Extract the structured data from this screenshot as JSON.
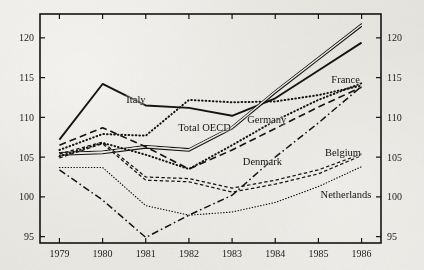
{
  "figure": {
    "background_color": "#e8e6e1",
    "ink_color": "#141414",
    "frame": "rectangular box with ticks on all four sides"
  },
  "chart_data": {
    "type": "line",
    "title": "",
    "subtitle": "",
    "xlabel": "",
    "ylabel": "",
    "x": [
      1979,
      1980,
      1981,
      1982,
      1983,
      1984,
      1985,
      1986
    ],
    "x_tick_labels": [
      "1979",
      "1980",
      "1981",
      "1982",
      "1983",
      "1984",
      "1985",
      "1986"
    ],
    "y_tick_labels_left": [
      "95",
      "100",
      "105",
      "110",
      "115",
      "120"
    ],
    "y_tick_labels_right": [
      "95",
      "100",
      "105",
      "110",
      "115",
      "120"
    ],
    "ylim": [
      94.2,
      123.0
    ],
    "xlim": [
      1978.55,
      1986.45
    ],
    "grid": false,
    "legend_position": "inline-annotations",
    "axis_sides": [
      "left",
      "right",
      "bottom",
      "top"
    ],
    "series": [
      {
        "name": "Italy",
        "style": "solid",
        "label_position": "inline",
        "values": [
          107.2,
          114.2,
          111.5,
          111.2,
          110.2,
          112.4,
          115.9,
          119.4
        ]
      },
      {
        "name": "Total OECD",
        "style": "dotted",
        "label_position": "inline",
        "values": [
          105.9,
          107.9,
          107.7,
          112.2,
          111.9,
          112.0,
          112.8,
          114.0
        ]
      },
      {
        "name": "Germany",
        "style": "double-line",
        "label_position": "inline",
        "values": [
          105.4,
          105.6,
          106.3,
          105.9,
          108.7,
          113.2,
          117.4,
          121.6
        ]
      },
      {
        "name": "France",
        "style": "dotted",
        "label_position": "inline",
        "values": [
          105.1,
          106.8,
          105.3,
          103.5,
          106.5,
          109.6,
          112.2,
          114.3
        ]
      },
      {
        "name": "Denmark",
        "style": "dashed",
        "label_position": "inline",
        "values": [
          106.5,
          108.7,
          106.3,
          103.5,
          105.9,
          108.6,
          111.3,
          113.8
        ]
      },
      {
        "name": "Belgium",
        "style": "short-dash",
        "label_position": "inline",
        "values": [
          104.9,
          106.7,
          102.1,
          101.9,
          100.6,
          101.6,
          102.9,
          105.2
        ]
      },
      {
        "name": "Netherlands",
        "style": "fine-dotted",
        "label_position": "inline",
        "values": [
          103.7,
          103.7,
          98.9,
          97.7,
          98.1,
          99.3,
          101.3,
          103.8
        ]
      },
      {
        "name": "unlabeled-dash-dot",
        "style": "dash-dot",
        "label_position": "none",
        "values": [
          103.4,
          99.6,
          94.9,
          97.7,
          100.2,
          105.0,
          109.3,
          113.9
        ]
      },
      {
        "name": "Belgium-pair",
        "style": "short-dash",
        "label_position": "none",
        "values": [
          105.4,
          106.9,
          102.5,
          102.3,
          101.1,
          102.1,
          103.4,
          105.4
        ]
      }
    ],
    "annotations": [
      {
        "text": "Italy",
        "x": 1980.55,
        "y": 112.0
      },
      {
        "text": "Total OECD",
        "x": 1981.75,
        "y": 108.6
      },
      {
        "text": "Germany",
        "x": 1983.35,
        "y": 109.6
      },
      {
        "text": "France",
        "x": 1985.3,
        "y": 114.6
      },
      {
        "text": "Denmark",
        "x": 1983.25,
        "y": 104.2
      },
      {
        "text": "Belgium",
        "x": 1985.15,
        "y": 105.4
      },
      {
        "text": "Netherlands",
        "x": 1985.05,
        "y": 100.1
      }
    ]
  }
}
